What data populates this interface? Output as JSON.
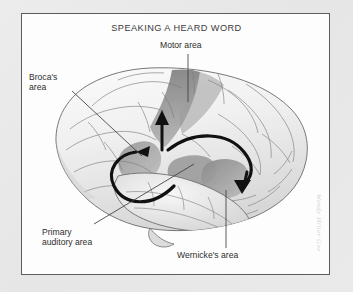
{
  "figure": {
    "title": "SPEAKING A HEARD WORD",
    "type": "anatomical-diagram",
    "signature": "Wendy Hiller Gee"
  },
  "labels": {
    "motor": "Motor area",
    "broca_line1": "Broca's",
    "broca_line2": "area",
    "primary_line1": "Primary",
    "primary_line2": "auditory area",
    "wernicke": "Wernicke's area"
  },
  "regions": [
    {
      "name": "motor-area",
      "shade": "#8d8d8d"
    },
    {
      "name": "brocas-area",
      "shade": "#9a9a9a"
    },
    {
      "name": "primary-auditory-area",
      "shade": "#a0a0a0"
    },
    {
      "name": "wernickes-area",
      "shade": "#8a8a8a"
    }
  ],
  "pathway": [
    {
      "name": "auditory-to-wernicke-arrow"
    },
    {
      "name": "wernicke-to-broca-arrow"
    },
    {
      "name": "broca-to-motor-arrow"
    }
  ],
  "colors": {
    "page_background": "#e8e8e8",
    "plate_background": "#fdfdfd",
    "frame_border": "#5c5c5c",
    "text": "#2e2e2e",
    "title_text": "#3a3a3a",
    "arrow": "#111111",
    "leader_line": "#3d3d3d",
    "brain_outline": "#6a6a6a",
    "brain_fill": "#f1f1f1",
    "signature": "#d2d2d2"
  }
}
